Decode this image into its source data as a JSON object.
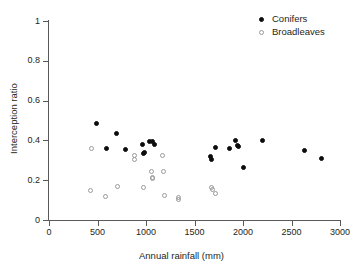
{
  "chart_data": {
    "type": "scatter",
    "title": "",
    "xlabel": "Annual rainfall (mm)",
    "ylabel": "Interception ratio",
    "xlim": [
      0,
      3000
    ],
    "ylim": [
      0,
      1
    ],
    "xticks": [
      0,
      500,
      1000,
      1500,
      2000,
      2500,
      3000
    ],
    "xtick_labels": [
      "0",
      "500",
      "1000",
      "1500",
      "2000",
      "2500",
      "3000"
    ],
    "yticks": [
      0,
      0.2,
      0.4,
      0.6,
      0.8,
      1
    ],
    "ytick_labels": [
      "0",
      "0.2",
      "0.4",
      "0.6",
      "0.8",
      "1"
    ],
    "grid": false,
    "legend_position": "top-right",
    "series": [
      {
        "name": "Conifers",
        "marker": "filled-circle",
        "color": "#0d0d0d",
        "points": [
          [
            490,
            0.485
          ],
          [
            595,
            0.358
          ],
          [
            700,
            0.437
          ],
          [
            790,
            0.355
          ],
          [
            965,
            0.378
          ],
          [
            975,
            0.333
          ],
          [
            985,
            0.34
          ],
          [
            1040,
            0.392
          ],
          [
            1065,
            0.393
          ],
          [
            1090,
            0.378
          ],
          [
            1665,
            0.318
          ],
          [
            1675,
            0.303
          ],
          [
            1720,
            0.362
          ],
          [
            1860,
            0.36
          ],
          [
            1925,
            0.4
          ],
          [
            1940,
            0.372
          ],
          [
            1955,
            0.367
          ],
          [
            2010,
            0.266
          ],
          [
            2200,
            0.397
          ],
          [
            2630,
            0.35
          ],
          [
            2810,
            0.307
          ]
        ]
      },
      {
        "name": "Broadleaves",
        "marker": "open-circle",
        "color": "#9a9a9a",
        "points": [
          [
            435,
            0.36
          ],
          [
            430,
            0.15
          ],
          [
            585,
            0.12
          ],
          [
            710,
            0.17
          ],
          [
            880,
            0.322
          ],
          [
            885,
            0.303
          ],
          [
            975,
            0.165
          ],
          [
            1055,
            0.243
          ],
          [
            1065,
            0.216
          ],
          [
            1070,
            0.208
          ],
          [
            1175,
            0.325
          ],
          [
            1185,
            0.243
          ],
          [
            1195,
            0.124
          ],
          [
            1330,
            0.113
          ],
          [
            1335,
            0.103
          ],
          [
            1680,
            0.163
          ],
          [
            1685,
            0.152
          ],
          [
            1720,
            0.133
          ]
        ]
      }
    ]
  },
  "legend": {
    "entries": [
      {
        "label": "Conifers",
        "marker": "filled-circle"
      },
      {
        "label": "Broadleaves",
        "marker": "open-circle"
      }
    ]
  }
}
